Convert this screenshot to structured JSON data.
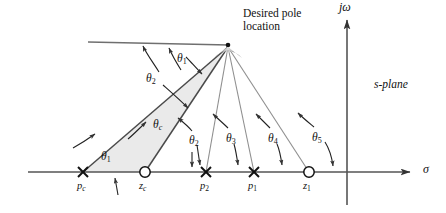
{
  "figure": {
    "plane_label": "s-plane",
    "desired_pole_label_line1": "Desired pole",
    "desired_pole_label_line2": "location",
    "axes": {
      "imaginary_label": "jω",
      "real_label": "σ"
    },
    "colors": {
      "background": "#ffffff",
      "line": "#3a3a3a",
      "thin_line": "#8a8a8a",
      "axis": "#555555",
      "shade": "#e9e9e9",
      "fan": "#9a9a9a",
      "text": "#111111"
    },
    "desired_pole": {
      "x": 228,
      "y": 46
    },
    "real_axis_y": 172,
    "imag_axis_x": 347,
    "markers": [
      {
        "name": "p_c",
        "type": "pole",
        "symbol": "×",
        "label": "p",
        "sub": "c",
        "x": 83
      },
      {
        "name": "z_c",
        "type": "zero",
        "symbol": "○",
        "label": "z",
        "sub": "c",
        "x": 145
      },
      {
        "name": "p_2",
        "type": "pole",
        "symbol": "×",
        "label": "p",
        "sub": "2",
        "x": 206
      },
      {
        "name": "p_1",
        "type": "pole",
        "symbol": "×",
        "label": "p",
        "sub": "1",
        "x": 254
      },
      {
        "name": "z_1",
        "type": "zero",
        "symbol": "○",
        "label": "z",
        "sub": "1",
        "x": 309
      }
    ],
    "angles": [
      {
        "name": "theta-1-top",
        "label": "θ",
        "sub": "1",
        "x": 177,
        "y": 52,
        "sub_italic": false
      },
      {
        "name": "theta-2-upper",
        "label": "θ",
        "sub": "2",
        "x": 148,
        "y": 74,
        "sub_italic": false
      },
      {
        "name": "theta-c",
        "label": "θ",
        "sub": "c",
        "x": 155,
        "y": 121,
        "sub_italic": true
      },
      {
        "name": "theta-1-bottom",
        "label": "θ",
        "sub": "1",
        "x": 103,
        "y": 153,
        "sub_italic": false
      },
      {
        "name": "theta-2-lower",
        "label": "θ",
        "sub": "2",
        "x": 191,
        "y": 137,
        "sub_italic": false
      },
      {
        "name": "theta-3",
        "label": "θ",
        "sub": "3",
        "x": 229,
        "y": 135,
        "sub_italic": false
      },
      {
        "name": "theta-4",
        "label": "θ",
        "sub": "4",
        "x": 271,
        "y": 135,
        "sub_italic": false
      },
      {
        "name": "theta-5",
        "label": "θ",
        "sub": "5",
        "x": 315,
        "y": 134,
        "sub_italic": false
      }
    ],
    "reference_line": {
      "x1": 88,
      "y1": 42,
      "x2": 228,
      "y2": 45
    },
    "desired_label_pos": {
      "x": 243,
      "y": 9
    },
    "splane_label_pos": {
      "x": 374,
      "y": 78
    },
    "jw_label_pos": {
      "x": 339,
      "y": 3
    },
    "sigma_label_pos": {
      "x": 423,
      "y": 164
    }
  }
}
